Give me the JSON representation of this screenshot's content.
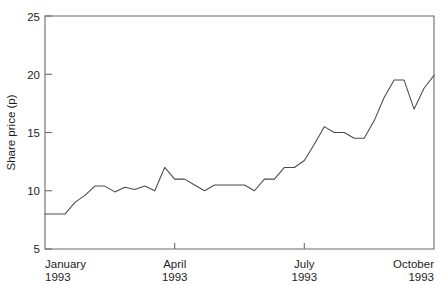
{
  "chart_data": {
    "type": "line",
    "title": "",
    "subtitle": "",
    "xlabel": "",
    "ylabel": "Share price (p)",
    "ylim": [
      5,
      25
    ],
    "ytick_values": [
      5,
      10,
      15,
      20,
      25
    ],
    "ytick_labels": [
      "5",
      "10",
      "15",
      "20",
      "25"
    ],
    "xtick_labels": [
      {
        "month": "January",
        "year": "1993"
      },
      {
        "month": "April",
        "year": "1993"
      },
      {
        "month": "July",
        "year": "1993"
      },
      {
        "month": "October",
        "year": "1993"
      }
    ],
    "xtick_positions": [
      0,
      13,
      26,
      39
    ],
    "xlim": [
      0,
      39
    ],
    "grid": false,
    "legend": null,
    "series": [
      {
        "name": "Share price",
        "x": [
          0,
          1,
          2,
          3,
          4,
          5,
          6,
          7,
          8,
          9,
          10,
          11,
          12,
          13,
          14,
          15,
          16,
          17,
          18,
          19,
          20,
          21,
          22,
          23,
          24,
          25,
          26,
          27,
          28,
          29,
          30,
          31,
          32,
          33,
          34,
          35,
          36,
          37,
          38,
          39
        ],
        "values": [
          8.0,
          8.0,
          8.0,
          9.0,
          9.6,
          10.4,
          10.4,
          9.9,
          10.3,
          10.1,
          10.4,
          10.0,
          12.0,
          11.0,
          11.0,
          10.5,
          10.0,
          10.5,
          10.5,
          10.5,
          10.5,
          10.0,
          11.0,
          11.0,
          12.0,
          12.0,
          12.6,
          14.0,
          15.5,
          15.0,
          15.0,
          14.5,
          14.5,
          16.0,
          18.0,
          19.5,
          19.5,
          17.0,
          18.8,
          19.9
        ]
      }
    ],
    "axis_color": "#6b6b6b",
    "line_color": "#4a4a4a",
    "background_color": "#ffffff"
  },
  "figure": {
    "caption_ghost": "",
    "alt": "Line chart of share price in pence from January 1993 to October 1993"
  }
}
